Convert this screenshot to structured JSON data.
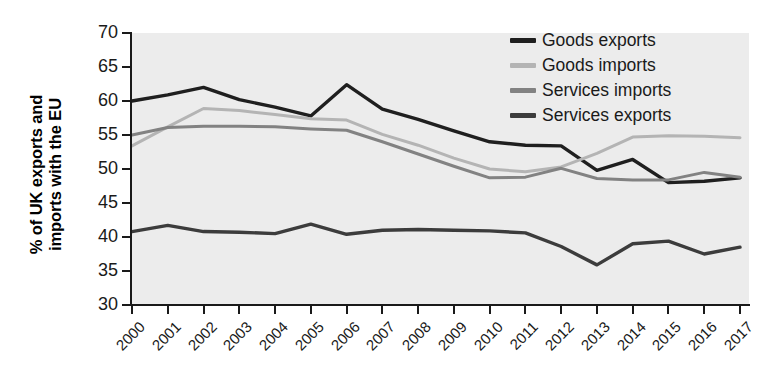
{
  "chart_data": {
    "type": "line",
    "title": "",
    "xlabel": "",
    "ylabel": "% of UK exports and\nimports with the EU",
    "x": [
      2000,
      2001,
      2002,
      2003,
      2004,
      2005,
      2006,
      2007,
      2008,
      2009,
      2010,
      2011,
      2012,
      2013,
      2014,
      2015,
      2016,
      2017
    ],
    "categories": [
      "2000",
      "2001",
      "2002",
      "2003",
      "2004",
      "2005",
      "2006",
      "2007",
      "2008",
      "2009",
      "2010",
      "2011",
      "2012",
      "2013",
      "2014",
      "2015",
      "2016",
      "2017"
    ],
    "ylim": [
      30,
      70
    ],
    "yticks": [
      30,
      35,
      40,
      45,
      50,
      55,
      60,
      65,
      70
    ],
    "grid": false,
    "legend_position": "top-right",
    "plot_background": "#ececec",
    "series": [
      {
        "name": "Goods exports",
        "color": "#1f1f1f",
        "width": 3.4,
        "values": [
          60.0,
          60.9,
          62.0,
          60.2,
          59.1,
          57.8,
          62.4,
          58.8,
          57.3,
          55.6,
          54.0,
          53.5,
          53.4,
          49.8,
          51.4,
          48.0,
          48.2,
          48.7
        ]
      },
      {
        "name": "Goods imports",
        "color": "#b4b4b4",
        "width": 3.0,
        "values": [
          53.4,
          56.2,
          58.9,
          58.6,
          58.0,
          57.4,
          57.2,
          55.1,
          53.5,
          51.6,
          50.0,
          49.6,
          50.3,
          52.3,
          54.7,
          54.9,
          54.8,
          54.6
        ]
      },
      {
        "name": "Services imports",
        "color": "#828282",
        "width": 3.0,
        "values": [
          55.0,
          56.1,
          56.3,
          56.3,
          56.2,
          55.9,
          55.7,
          54.0,
          52.2,
          50.4,
          48.7,
          48.8,
          50.1,
          48.6,
          48.4,
          48.4,
          49.5,
          48.8
        ]
      },
      {
        "name": "Services exports",
        "color": "#3c3c3c",
        "width": 3.4,
        "values": [
          40.8,
          41.7,
          40.8,
          40.7,
          40.5,
          41.9,
          40.4,
          41.0,
          41.1,
          41.0,
          40.9,
          40.6,
          38.6,
          35.9,
          39.0,
          39.4,
          37.5,
          38.5
        ]
      }
    ]
  },
  "legend": {
    "items": [
      {
        "label": "Goods exports",
        "color": "#1f1f1f"
      },
      {
        "label": "Goods imports",
        "color": "#b4b4b4"
      },
      {
        "label": "Services imports",
        "color": "#828282"
      },
      {
        "label": "Services exports",
        "color": "#3c3c3c"
      }
    ]
  },
  "axes": {
    "y_title": "% of UK exports and\nimports with the EU",
    "y_tick_labels": [
      "70",
      "65",
      "60",
      "55",
      "50",
      "45",
      "40",
      "35",
      "30"
    ],
    "x_tick_labels": [
      "2000",
      "2001",
      "2002",
      "2003",
      "2004",
      "2005",
      "2006",
      "2007",
      "2008",
      "2009",
      "2010",
      "2011",
      "2012",
      "2013",
      "2014",
      "2015",
      "2016",
      "2017"
    ]
  }
}
